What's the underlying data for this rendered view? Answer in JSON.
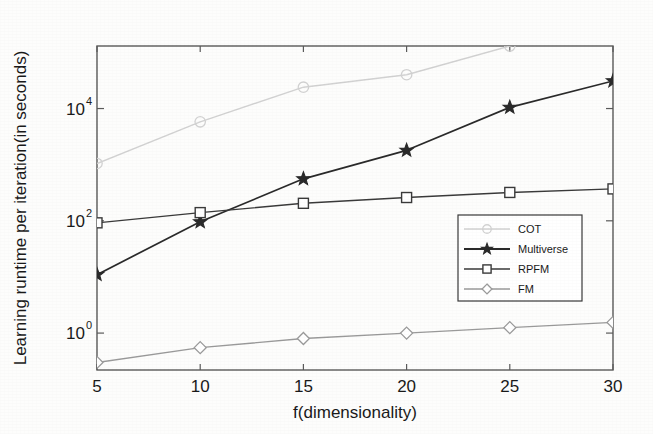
{
  "chart_data": {
    "type": "line",
    "title": "",
    "xlabel": "f(dimensionality)",
    "ylabel": "Learning runtime per iteration(in seconds)",
    "x": [
      5,
      10,
      15,
      20,
      25,
      30
    ],
    "xtick_labels": [
      "5",
      "10",
      "15",
      "20",
      "25",
      "30"
    ],
    "xlim": [
      5,
      30
    ],
    "yscale": "log",
    "ylim": [
      0.22,
      130000
    ],
    "ytick_labels": [
      "10^0",
      "10^2",
      "10^4"
    ],
    "ytick_values": [
      1,
      100,
      10000
    ],
    "ytick_mantissa": [
      "10",
      "10",
      "10"
    ],
    "ytick_exponent": [
      "0",
      "2",
      "4"
    ],
    "grid": false,
    "legend_position": "lower right",
    "series": [
      {
        "name": "COT",
        "marker": "circle",
        "color": "#d2d2d2",
        "values": [
          1050,
          5800,
          24000,
          40000,
          130000,
          400000
        ],
        "clipped_above_axis_from_x": 23
      },
      {
        "name": "Multiverse",
        "marker": "star",
        "color": "#2a2a2a",
        "values": [
          11,
          96,
          560,
          1800,
          10500,
          31000
        ]
      },
      {
        "name": "RPFM",
        "marker": "square",
        "color": "#3a3a3a",
        "values": [
          92,
          140,
          205,
          260,
          320,
          370
        ]
      },
      {
        "name": "FM",
        "marker": "diamond",
        "color": "#9a9a9a",
        "values": [
          0.3,
          0.55,
          0.8,
          1.0,
          1.25,
          1.55
        ]
      }
    ],
    "legend_entries": [
      {
        "label": "COT",
        "marker": "circle",
        "color": "#d2d2d2"
      },
      {
        "label": "Multiverse",
        "marker": "star",
        "color": "#2a2a2a"
      },
      {
        "label": "RPFM",
        "marker": "square",
        "color": "#3a3a3a"
      },
      {
        "label": "FM",
        "marker": "diamond",
        "color": "#9a9a9a"
      }
    ]
  },
  "axes": {
    "frame_color": "#5a5a5a"
  }
}
